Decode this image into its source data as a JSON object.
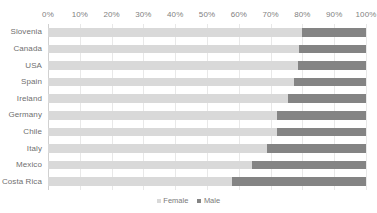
{
  "chart_data": {
    "type": "bar",
    "orientation": "horizontal",
    "stacked": true,
    "stacked_normalized": true,
    "title": "",
    "xlabel": "",
    "ylabel": "",
    "xlim": [
      0,
      100
    ],
    "grid": true,
    "legend_position": "bottom",
    "axis_position": "top",
    "categories": [
      "Slovenia",
      "Canada",
      "USA",
      "Spain",
      "Ireland",
      "Germany",
      "Chile",
      "Italy",
      "Mexico",
      "Costa Rica"
    ],
    "tick_labels": [
      "0%",
      "10%",
      "20%",
      "30%",
      "40%",
      "50%",
      "60%",
      "70%",
      "80%",
      "90%",
      "100%"
    ],
    "tick_values": [
      0,
      10,
      20,
      30,
      40,
      50,
      60,
      70,
      80,
      90,
      100
    ],
    "series": [
      {
        "name": "Female",
        "color": "#d9d9d9",
        "values": [
          80,
          79,
          78.5,
          77.5,
          75.5,
          72,
          72,
          69,
          64,
          58
        ]
      },
      {
        "name": "Male",
        "color": "#848484",
        "values": [
          20,
          21,
          21.5,
          22.5,
          24.5,
          28,
          28,
          31,
          36,
          42
        ]
      }
    ]
  },
  "legend": {
    "items": [
      {
        "label": "Female",
        "color": "#d9d9d9"
      },
      {
        "label": "Male",
        "color": "#848484"
      }
    ]
  },
  "colors": {
    "female": "#d9d9d9",
    "male": "#848484",
    "gridline": "#e8e8e8",
    "text": "#7f7f7f",
    "background": "#ffffff"
  }
}
